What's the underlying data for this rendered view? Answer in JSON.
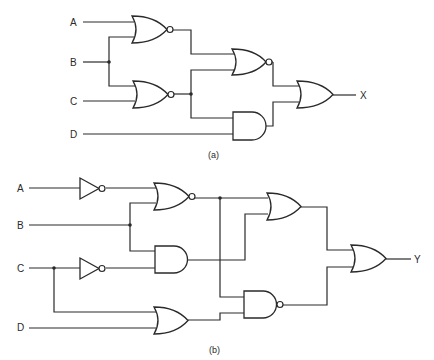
{
  "diagrams": {
    "a": {
      "caption": "(a)",
      "inputs": [
        "A",
        "B",
        "C",
        "D"
      ],
      "output": "X",
      "gates": [
        {
          "id": "g1",
          "type": "NOR",
          "inputs": [
            "A",
            "B"
          ]
        },
        {
          "id": "g2",
          "type": "NOR",
          "inputs": [
            "B",
            "C"
          ]
        },
        {
          "id": "g3",
          "type": "NOR",
          "inputs": [
            "g1",
            "g2"
          ]
        },
        {
          "id": "g4",
          "type": "AND",
          "inputs": [
            "g2",
            "D"
          ]
        },
        {
          "id": "g5",
          "type": "OR",
          "inputs": [
            "g3",
            "g4"
          ],
          "output": "X"
        }
      ]
    },
    "b": {
      "caption": "(b)",
      "inputs": [
        "A",
        "B",
        "C",
        "D"
      ],
      "output": "Y",
      "gates": [
        {
          "id": "n1",
          "type": "NOT",
          "inputs": [
            "A"
          ]
        },
        {
          "id": "n2",
          "type": "NOT",
          "inputs": [
            "C"
          ]
        },
        {
          "id": "h1",
          "type": "NOR",
          "inputs": [
            "n1",
            "B"
          ]
        },
        {
          "id": "h2",
          "type": "AND",
          "inputs": [
            "B",
            "n2"
          ]
        },
        {
          "id": "h3",
          "type": "OR",
          "inputs": [
            "C",
            "D"
          ]
        },
        {
          "id": "h4",
          "type": "OR",
          "inputs": [
            "h1",
            "h2"
          ]
        },
        {
          "id": "h5",
          "type": "NAND",
          "inputs": [
            "h1",
            "h3"
          ]
        },
        {
          "id": "h6",
          "type": "OR",
          "inputs": [
            "h4",
            "h5"
          ],
          "output": "Y"
        }
      ]
    }
  }
}
